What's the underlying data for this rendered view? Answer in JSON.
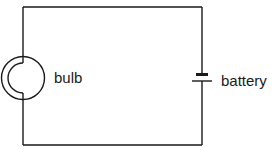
{
  "diagram": {
    "type": "circuit",
    "components": [
      {
        "id": "bulb",
        "symbol": "lamp",
        "label": "bulb"
      },
      {
        "id": "battery",
        "symbol": "cell",
        "label": "battery"
      }
    ],
    "colors": {
      "line": "#1a1a1a",
      "background": "#ffffff"
    }
  }
}
